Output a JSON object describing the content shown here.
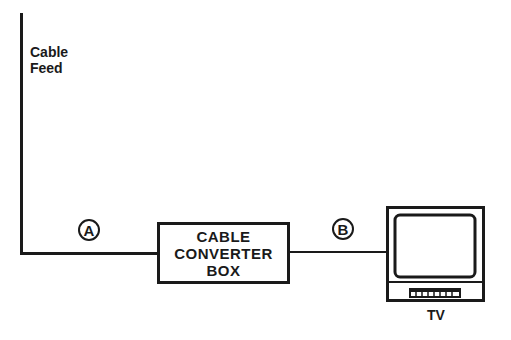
{
  "diagram": {
    "cable_feed": {
      "label_line1": "Cable",
      "label_line2": "Feed"
    },
    "connection_a": {
      "label": "A"
    },
    "converter_box": {
      "line1": "CABLE",
      "line2": "CONVERTER",
      "line3": "BOX"
    },
    "connection_b": {
      "label": "B"
    },
    "tv": {
      "label": "TV"
    },
    "colors": {
      "ink": "#1a1a1a",
      "background": "#ffffff"
    }
  }
}
